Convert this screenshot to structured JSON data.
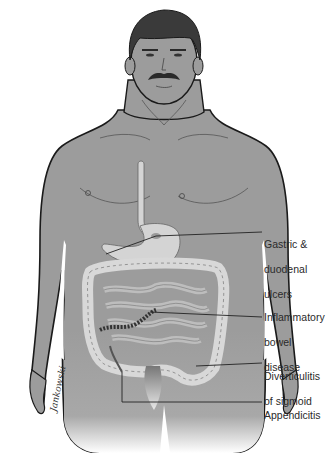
{
  "diagram": {
    "colors": {
      "skin": "#9c9c9c",
      "skin_shadow": "#8a8a8a",
      "outline": "#1a1a1a",
      "hair": "#3a3a3a",
      "organ": "#d4d4d4",
      "organ_outline": "#555555",
      "leader_line": "#222222",
      "background": "#ffffff"
    },
    "signature": "Jankowski",
    "labels": [
      {
        "id": "gastric",
        "lines": [
          "Gastric &",
          "duodenal",
          "ulcers"
        ]
      },
      {
        "id": "ibd",
        "lines": [
          "Inflammatory",
          "bowel",
          "disease"
        ]
      },
      {
        "id": "diverticulitis",
        "lines": [
          "Diverticulitis",
          "of sigmoid"
        ]
      },
      {
        "id": "appendicitis",
        "lines": [
          "Appendicitis"
        ]
      }
    ]
  }
}
